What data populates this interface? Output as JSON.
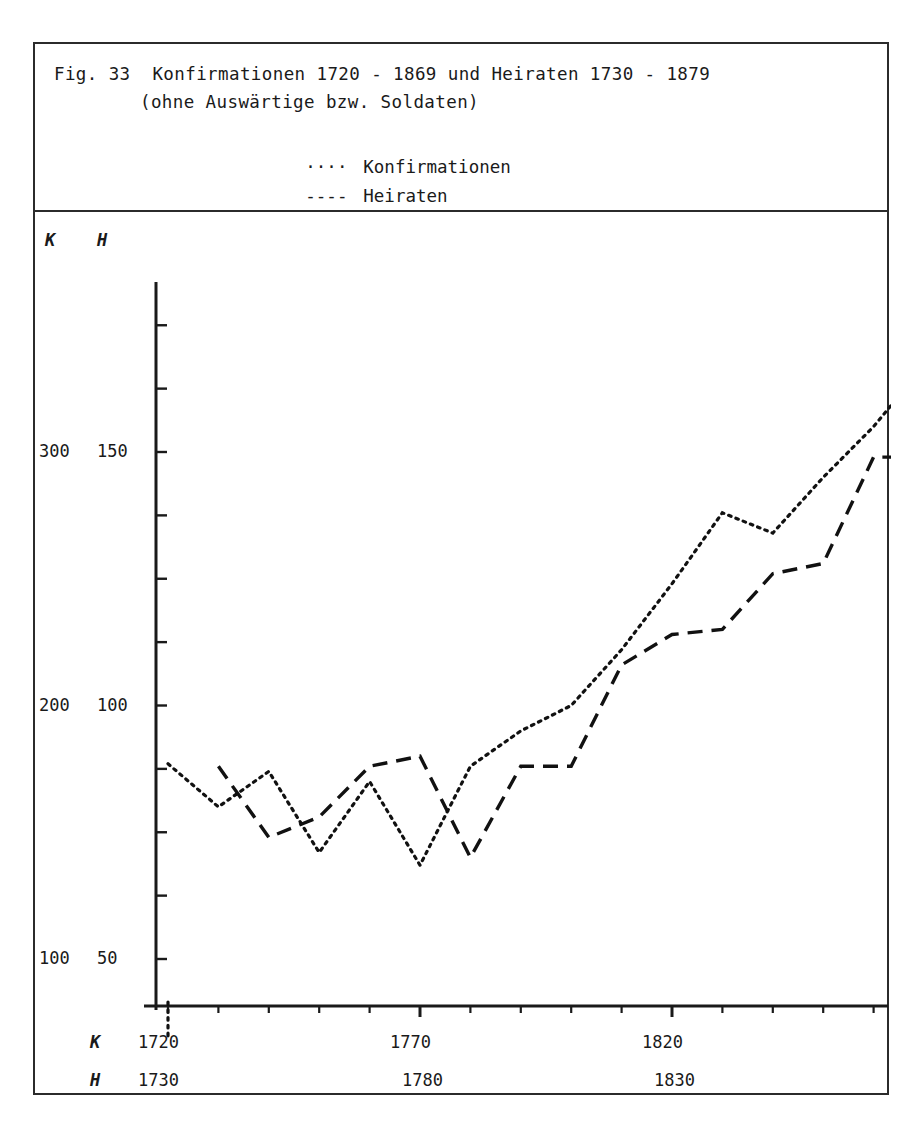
{
  "figure": {
    "caption_line_1": "Fig. 33  Konfirmationen 1720 - 1869 und Heiraten 1730 - 1879",
    "caption_line_2": "(ohne Auswärtige bzw. Soldaten)"
  },
  "legend": {
    "konfirmationen": {
      "marker": "····",
      "label": "Konfirmationen"
    },
    "heiraten": {
      "marker": "----",
      "label": "Heiraten"
    }
  },
  "axes": {
    "y_header_k": "K",
    "y_header_h": "H",
    "x_row_key_k": "K",
    "x_row_key_h": "H",
    "y_ticks_k": [
      "300",
      "200",
      "100"
    ],
    "y_ticks_h": [
      "150",
      "100",
      "50"
    ],
    "x_ticks_k": [
      "1720",
      "1770",
      "1820"
    ],
    "x_ticks_h": [
      "1730",
      "1780",
      "1830"
    ]
  },
  "chart_data": {
    "type": "line",
    "title": "Fig. 33  Konfirmationen 1720 - 1869 und Heiraten 1730 - 1879",
    "subtitle": "(ohne Auswärtige bzw. Soldaten)",
    "xlabel": "",
    "ylabel": "",
    "grid": false,
    "legend_position": "top",
    "axis_note": "Dual scale: K (Konfirmationen) left value, H (Heiraten) right value; K axis 100-300, H axis 50-150. K decades start 1720, H decades start 1730.",
    "xlim_k": [
      1720,
      1870
    ],
    "xlim_h": [
      1730,
      1880
    ],
    "ylim_k": [
      60,
      340
    ],
    "ylim_h": [
      30,
      170
    ],
    "x_tick_step_years": 10,
    "series": [
      {
        "name": "Konfirmationen",
        "style": "dotted",
        "x_start_decade": 1720,
        "x": [
          1720,
          1730,
          1740,
          1750,
          1760,
          1770,
          1780,
          1790,
          1800,
          1810,
          1820,
          1830,
          1840,
          1850,
          1860,
          1870
        ],
        "values": [
          177,
          160,
          174,
          142,
          170,
          137,
          176,
          190,
          200,
          222,
          248,
          276,
          268,
          290,
          310,
          334
        ]
      },
      {
        "name": "Heiraten",
        "style": "dashed",
        "x_start_decade": 1730,
        "x": [
          1730,
          1740,
          1750,
          1760,
          1770,
          1780,
          1790,
          1800,
          1810,
          1820,
          1830,
          1840,
          1850,
          1860,
          1870,
          1880
        ],
        "values": [
          88,
          74,
          78,
          88,
          90,
          70,
          88,
          88,
          108,
          114,
          115,
          126,
          128,
          149,
          149,
          149
        ]
      }
    ]
  },
  "plot_geometry": {
    "note": "pixel mapping inside plot-area (883px tall, 856 wide)",
    "x_origin_px": 133,
    "x_step_px": 50.4,
    "y_val100k_px": 747,
    "y_val300k_px": 240,
    "axis_left_px": 121,
    "axis_bottom_px": 794
  }
}
